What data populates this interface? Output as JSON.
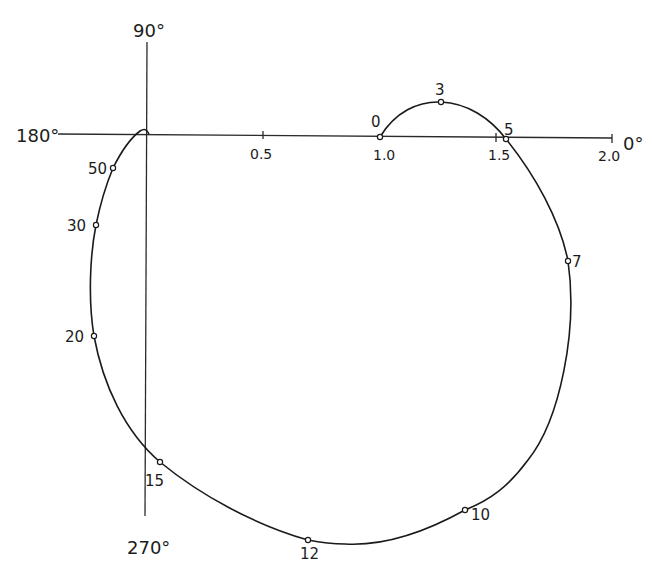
{
  "diagram": {
    "type": "polar-frequency-locus",
    "axis_labels": {
      "angle_0": "0°",
      "angle_90": "90°",
      "angle_180": "180°",
      "angle_270": "270°"
    },
    "real_axis_ticks": [
      {
        "value": 0.5,
        "label": "0.5"
      },
      {
        "value": 1.0,
        "label": "1.0"
      },
      {
        "value": 1.5,
        "label": "1.5"
      },
      {
        "value": 2.0,
        "label": "2.0"
      }
    ],
    "points": [
      {
        "label": "0",
        "re": 1.0,
        "im": 0.0
      },
      {
        "label": "3",
        "re": 1.26,
        "im": 0.15
      },
      {
        "label": "5",
        "re": 1.55,
        "im": -0.01
      },
      {
        "label": "7",
        "re": 1.81,
        "im": -0.54
      },
      {
        "label": "10",
        "re": 1.37,
        "im": -1.61
      },
      {
        "label": "12",
        "re": 0.7,
        "im": -1.74
      },
      {
        "label": "15",
        "re": 0.06,
        "im": -1.4
      },
      {
        "label": "20",
        "re": -0.22,
        "im": -0.86
      },
      {
        "label": "30",
        "re": -0.21,
        "im": -0.38
      },
      {
        "label": "50",
        "re": -0.14,
        "im": -0.14
      }
    ]
  },
  "labels": {
    "top": "90°",
    "left": "180°",
    "right": "0°",
    "bottom": "270°",
    "tick_05": "0.5",
    "tick_10": "1.0",
    "tick_15": "1.5",
    "tick_20": "2.0",
    "p0": "0",
    "p3": "3",
    "p5": "5",
    "p7": "7",
    "p10": "10",
    "p12": "12",
    "p15": "15",
    "p20": "20",
    "p30": "30",
    "p50": "50"
  }
}
